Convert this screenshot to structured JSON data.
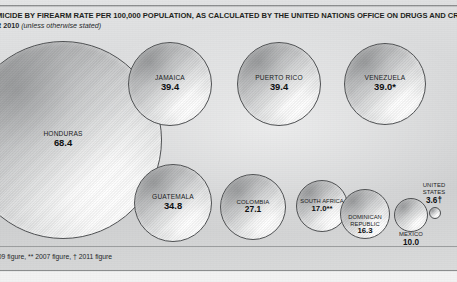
{
  "header": {
    "title": "MICIDE BY FIREARM RATE PER 100,000 POPULATION, AS CALCULATED BY THE UNITED NATIONS OFFICE ON DRUGS AND CRIME (UNODC)",
    "year": "R 2010",
    "qualifier": "(unless otherwise stated)"
  },
  "footnote": {
    "text": "009 figure, ** 2007 figure, † 2011 figure"
  },
  "colors": {
    "background": "#d5d6d7",
    "bubble_stroke": "#4e5052",
    "text": "#141617",
    "rule": "#8d8f90"
  },
  "chart_data": {
    "type": "bubble",
    "title": "MICIDE BY FIREARM RATE PER 100,000 POPULATION, AS CALCULATED BY THE UNITED NATIONS OFFICE ON DRUGS AND CRIME (UNODC)",
    "subtitle": "R 2010 (unless otherwise stated)",
    "unit": "homicides by firearm per 100,000 population",
    "xlabel": "",
    "ylabel": "",
    "grid": false,
    "legend": "none",
    "size_encoding": "circle area proportional to rate",
    "footnotes": {
      "single_asterisk": "2009 figure",
      "double_asterisk": "2007 figure",
      "dagger": "2011 figure"
    },
    "categories": [
      "HONDURAS",
      "JAMAICA",
      "PUERTO RICO",
      "VENEZUELA",
      "GUATEMALA",
      "COLOMBIA",
      "SOUTH AFRICA",
      "DOMINICAN REPUBLIC",
      "MEXICO",
      "UNITED STATES"
    ],
    "values": [
      68.4,
      39.4,
      39.4,
      39.0,
      34.8,
      27.1,
      17.0,
      16.3,
      10.0,
      3.6
    ],
    "points": [
      {
        "name": "HONDURAS",
        "value": 68.4,
        "value_label": "68.4",
        "note": "",
        "label_placement": "inside",
        "cx": 63,
        "cy": 140,
        "r": 99
      },
      {
        "name": "JAMAICA",
        "value": 39.4,
        "value_label": "39.4",
        "note": "",
        "label_placement": "inside",
        "cx": 170,
        "cy": 84,
        "r": 42
      },
      {
        "name": "PUERTO RICO",
        "value": 39.4,
        "value_label": "39.4",
        "note": "",
        "label_placement": "inside",
        "cx": 279,
        "cy": 84,
        "r": 42
      },
      {
        "name": "VENEZUELA",
        "value": 39.0,
        "value_label": "39.0*",
        "note": "2009 figure",
        "label_placement": "inside",
        "cx": 385,
        "cy": 84,
        "r": 41
      },
      {
        "name": "GUATEMALA",
        "value": 34.8,
        "value_label": "34.8",
        "note": "",
        "label_placement": "inside",
        "cx": 173,
        "cy": 203,
        "r": 39
      },
      {
        "name": "COLOMBIA",
        "value": 27.1,
        "value_label": "27.1",
        "note": "",
        "label_placement": "inside",
        "cx": 253,
        "cy": 207,
        "r": 33
      },
      {
        "name": "SOUTH AFRICA",
        "value": 17.0,
        "value_label": "17.0**",
        "note": "2007 figure",
        "label_placement": "inside",
        "cx": 322,
        "cy": 206,
        "r": 26
      },
      {
        "name": "DOMINICAN REPUBLIC",
        "value": 16.3,
        "value_label": "16.3",
        "note": "",
        "label_placement": "inside",
        "cx": 365,
        "cy": 214,
        "r": 25
      },
      {
        "name": "MEXICO",
        "value": 10.0,
        "value_label": "10.0",
        "note": "",
        "label_placement": "below",
        "cx": 411,
        "cy": 215,
        "r": 17
      },
      {
        "name": "UNITED STATES",
        "value": 3.6,
        "value_label": "3.6†",
        "note": "2011 figure",
        "label_placement": "above",
        "cx": 435,
        "cy": 213,
        "r": 6
      }
    ]
  }
}
